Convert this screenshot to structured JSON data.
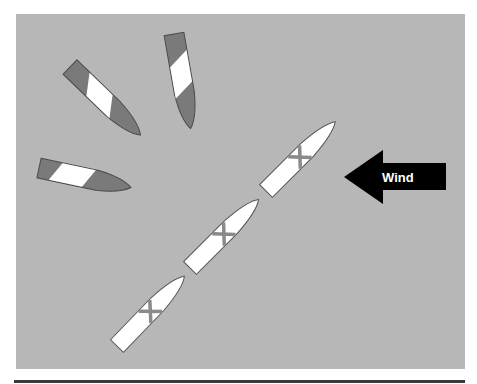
{
  "diagram": {
    "wind_arrow": {
      "label": "Wind",
      "direction": "left",
      "color": "#000000"
    },
    "colors": {
      "background": "#b7b7b7",
      "boat_stalled_fill": "#7a7a7a",
      "boat_sailing_fill": "#ffffff",
      "stripe": "#ffffff",
      "cross_mark": "#8a8a8a",
      "outline": "#555555",
      "bottom_rule": "#3a3a3a"
    },
    "boats": [
      {
        "id": "boat-1",
        "state": "luffing",
        "style": "gray-with-white-band"
      },
      {
        "id": "boat-2",
        "state": "luffing",
        "style": "gray-with-white-band"
      },
      {
        "id": "boat-3",
        "state": "luffing",
        "style": "gray-with-white-band"
      },
      {
        "id": "boat-4",
        "state": "close-hauled",
        "style": "white-with-x"
      },
      {
        "id": "boat-5",
        "state": "close-hauled",
        "style": "white-with-x"
      },
      {
        "id": "boat-6",
        "state": "close-hauled",
        "style": "white-with-x"
      }
    ]
  }
}
